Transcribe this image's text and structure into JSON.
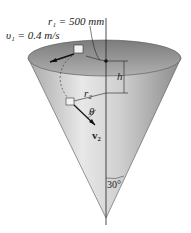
{
  "figure": {
    "labels": {
      "r1": "r₁ = 500 mm",
      "v1": "υ₁ = 0.4 m/s",
      "h": "h",
      "r2": "r₂",
      "theta": "θ",
      "v2": "v₂",
      "angle": "30°"
    },
    "colors": {
      "cone_light": "#e6e6e6",
      "cone_dark": "#9a9a9a",
      "rim_inner": "#8a8a8a",
      "line": "#222222"
    }
  }
}
